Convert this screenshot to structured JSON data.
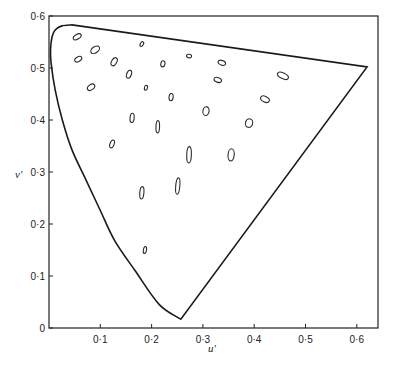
{
  "chart_data": {
    "type": "scatter",
    "title": "",
    "xlabel": "u'",
    "ylabel": "v'",
    "xlim": [
      0,
      0.64
    ],
    "ylim": [
      0,
      0.6
    ],
    "grid": false,
    "legend": null,
    "x_ticks": [
      {
        "value": 0.1,
        "label": "0·1"
      },
      {
        "value": 0.2,
        "label": "0·2"
      },
      {
        "value": 0.3,
        "label": "0·3"
      },
      {
        "value": 0.4,
        "label": "0·4"
      },
      {
        "value": 0.5,
        "label": "0·5"
      },
      {
        "value": 0.6,
        "label": "0·6"
      }
    ],
    "y_ticks": [
      {
        "value": 0,
        "label": "0"
      },
      {
        "value": 0.1,
        "label": "0·1"
      },
      {
        "value": 0.2,
        "label": "0·2"
      },
      {
        "value": 0.3,
        "label": "0·3"
      },
      {
        "value": 0.4,
        "label": "0·4"
      },
      {
        "value": 0.5,
        "label": "0·5"
      },
      {
        "value": 0.6,
        "label": "0·6"
      }
    ],
    "spectrum_locus": [
      [
        0.257,
        0.017
      ],
      [
        0.215,
        0.045
      ],
      [
        0.168,
        0.11
      ],
      [
        0.128,
        0.168
      ],
      [
        0.1,
        0.226
      ],
      [
        0.072,
        0.285
      ],
      [
        0.045,
        0.342
      ],
      [
        0.026,
        0.4
      ],
      [
        0.012,
        0.458
      ],
      [
        0.004,
        0.51
      ],
      [
        0.003,
        0.535
      ],
      [
        0.006,
        0.56
      ],
      [
        0.012,
        0.573
      ],
      [
        0.025,
        0.581
      ],
      [
        0.045,
        0.583
      ],
      [
        0.62,
        0.502
      ],
      [
        0.257,
        0.017
      ]
    ],
    "macadam_ellipses": [
      {
        "u": 0.055,
        "v": 0.56,
        "a": 0.017,
        "b": 0.009,
        "angle": 30
      },
      {
        "u": 0.09,
        "v": 0.535,
        "a": 0.019,
        "b": 0.012,
        "angle": 35
      },
      {
        "u": 0.057,
        "v": 0.517,
        "a": 0.015,
        "b": 0.009,
        "angle": 30
      },
      {
        "u": 0.127,
        "v": 0.512,
        "a": 0.017,
        "b": 0.01,
        "angle": 60
      },
      {
        "u": 0.156,
        "v": 0.488,
        "a": 0.016,
        "b": 0.009,
        "angle": 70
      },
      {
        "u": 0.181,
        "v": 0.546,
        "a": 0.01,
        "b": 0.006,
        "angle": 60
      },
      {
        "u": 0.082,
        "v": 0.463,
        "a": 0.016,
        "b": 0.01,
        "angle": 35
      },
      {
        "u": 0.189,
        "v": 0.462,
        "a": 0.01,
        "b": 0.006,
        "angle": 80
      },
      {
        "u": 0.222,
        "v": 0.508,
        "a": 0.012,
        "b": 0.008,
        "angle": 80
      },
      {
        "u": 0.273,
        "v": 0.523,
        "a": 0.01,
        "b": 0.007,
        "angle": -10
      },
      {
        "u": 0.337,
        "v": 0.51,
        "a": 0.015,
        "b": 0.009,
        "angle": -20
      },
      {
        "u": 0.329,
        "v": 0.477,
        "a": 0.015,
        "b": 0.009,
        "angle": -20
      },
      {
        "u": 0.238,
        "v": 0.444,
        "a": 0.014,
        "b": 0.008,
        "angle": 85
      },
      {
        "u": 0.306,
        "v": 0.417,
        "a": 0.017,
        "b": 0.012,
        "angle": 80
      },
      {
        "u": 0.421,
        "v": 0.44,
        "a": 0.018,
        "b": 0.011,
        "angle": -25
      },
      {
        "u": 0.39,
        "v": 0.394,
        "a": 0.017,
        "b": 0.014,
        "angle": 75
      },
      {
        "u": 0.456,
        "v": 0.485,
        "a": 0.023,
        "b": 0.011,
        "angle": -25
      },
      {
        "u": 0.162,
        "v": 0.404,
        "a": 0.018,
        "b": 0.008,
        "angle": 85
      },
      {
        "u": 0.212,
        "v": 0.387,
        "a": 0.024,
        "b": 0.007,
        "angle": 88
      },
      {
        "u": 0.123,
        "v": 0.354,
        "a": 0.016,
        "b": 0.008,
        "angle": 70
      },
      {
        "u": 0.273,
        "v": 0.333,
        "a": 0.032,
        "b": 0.009,
        "angle": 88
      },
      {
        "u": 0.355,
        "v": 0.333,
        "a": 0.024,
        "b": 0.012,
        "angle": 85
      },
      {
        "u": 0.251,
        "v": 0.273,
        "a": 0.032,
        "b": 0.008,
        "angle": 85
      },
      {
        "u": 0.181,
        "v": 0.26,
        "a": 0.024,
        "b": 0.008,
        "angle": 85
      },
      {
        "u": 0.187,
        "v": 0.15,
        "a": 0.014,
        "b": 0.006,
        "angle": 80
      }
    ]
  }
}
